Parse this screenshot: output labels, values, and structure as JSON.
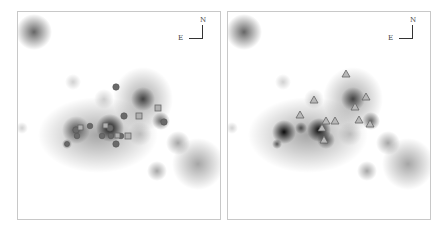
{
  "figure": {
    "panels": [
      {
        "id": "left",
        "compass": {
          "north_label": "N",
          "east_label": "E"
        },
        "marker_types": [
          "filled-circle",
          "open-square"
        ]
      },
      {
        "id": "right",
        "compass": {
          "north_label": "N",
          "east_label": "E"
        },
        "marker_types": [
          "open-triangle"
        ]
      }
    ],
    "colors": {
      "background": "#ffffff",
      "border": "#c8c8c8",
      "marker_circle": "#6a6a6a",
      "marker_square": "#8a8a8a",
      "marker_triangle": "#8a8a8a"
    }
  }
}
